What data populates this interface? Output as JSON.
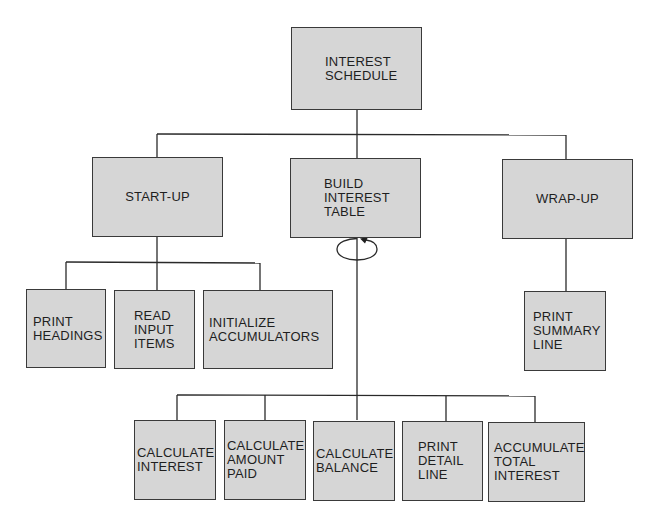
{
  "diagram": {
    "colors": {
      "box_fill": "#d6d6d6",
      "box_border": "#3a3a3a",
      "line": "#2a2a2a",
      "text": "#1e1e1e"
    },
    "root": {
      "label": "INTEREST\nSCHEDULE"
    },
    "level1": [
      {
        "id": "startup",
        "label": "START-UP"
      },
      {
        "id": "build",
        "label": "BUILD\nINTEREST\nTABLE",
        "loop": true
      },
      {
        "id": "wrapup",
        "label": "WRAP-UP"
      }
    ],
    "startup_children": [
      {
        "label": "PRINT\nHEADINGS"
      },
      {
        "label": "READ\nINPUT\nITEMS"
      },
      {
        "label": "INITIALIZE\nACCUMULATORS"
      }
    ],
    "build_children": [
      {
        "label": "CALCULATE\nINTEREST"
      },
      {
        "label": "CALCULATE\nAMOUNT\nPAID"
      },
      {
        "label": "CALCULATE\nBALANCE"
      },
      {
        "label": "PRINT\nDETAIL\nLINE"
      },
      {
        "label": "ACCUMULATE\nTOTAL\nINTEREST"
      }
    ],
    "wrapup_children": [
      {
        "label": "PRINT\nSUMMARY\nLINE"
      }
    ],
    "loop_symbol": "loop-iteration-icon"
  }
}
